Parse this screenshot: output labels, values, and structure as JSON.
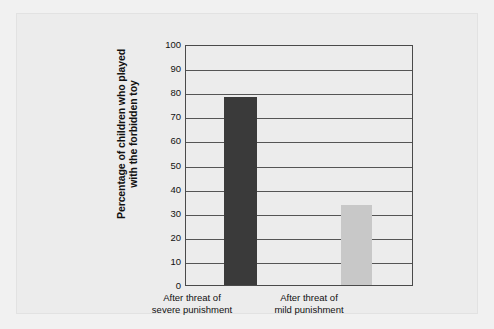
{
  "chart_data": {
    "type": "bar",
    "title": "",
    "xlabel": "",
    "ylabel_line1": "Percentage of children who played",
    "ylabel_line2": "with the forbidden toy",
    "categories": [
      {
        "line1": "After threat of",
        "line2": "severe punishment"
      },
      {
        "line1": "After threat of",
        "line2": "mild punishment"
      }
    ],
    "values": [
      78,
      33
    ],
    "ylim": [
      0,
      100
    ],
    "ytick_values": [
      100,
      90,
      80,
      70,
      60,
      50,
      40,
      30,
      20,
      10,
      0
    ],
    "grid": true,
    "legend": "none",
    "bar_colors": [
      "#3a3a3a",
      "#c8c8c8"
    ],
    "plot_border_color": "#4a4a4a",
    "gridline_color": "#555555",
    "background_color": "#ececec"
  }
}
